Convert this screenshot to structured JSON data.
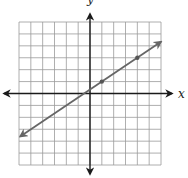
{
  "chart_data": {
    "type": "line",
    "title": "",
    "xlabel": "x",
    "ylabel": "y",
    "xlim": [
      -6,
      6
    ],
    "ylim": [
      -6,
      6
    ],
    "grid": true,
    "grid_step": 1,
    "series": [
      {
        "name": "line",
        "equation": "y = (2/3)x + 1/3",
        "slope": 0.6667,
        "intercept": 0.3333,
        "x_range": [
          -5.9,
          6.0
        ],
        "arrows": "both",
        "color": "#666666"
      }
    ],
    "points": [
      {
        "x": 1,
        "y": 1
      },
      {
        "x": 4,
        "y": 3
      }
    ]
  }
}
